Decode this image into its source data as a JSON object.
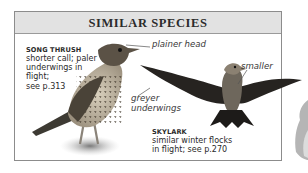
{
  "panel": {
    "title": "SIMILAR SPECIES"
  },
  "species": [
    {
      "name": "SONG THRUSH",
      "description_lines": [
        "shorter call; paler",
        "underwings in",
        "flight;",
        "see p.313"
      ]
    },
    {
      "name": "SKYLARK",
      "description_lines": [
        "similar winter flocks",
        "in flight; see p.270"
      ]
    }
  ],
  "annotations": {
    "plainer_head": "plainer head",
    "smaller": "smaller",
    "greyer_underwings_line1": "greyer",
    "greyer_underwings_line2": "underwings"
  },
  "colors": {
    "header_bg": "#e2e2e2",
    "border": "#8c8c8c",
    "text": "#2a2a2a"
  }
}
